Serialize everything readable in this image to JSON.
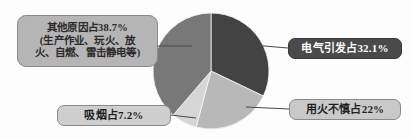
{
  "chart_data": {
    "type": "pie",
    "title": "",
    "xlabel": "",
    "ylabel": "",
    "legend_position": "callout-labels",
    "grid": false,
    "start_angle_deg": 0,
    "direction": "clockwise",
    "categories": [
      "电气引发",
      "用火不慎",
      "吸烟",
      "其他原因"
    ],
    "values": [
      32.1,
      22.0,
      7.2,
      38.7
    ],
    "unit": "%",
    "colors": [
      "#434343",
      "#b8b8b8",
      "#d6d6d6",
      "#787878"
    ],
    "slices": [
      {
        "name": "电气引发",
        "value": 32.1,
        "label": "电气引发占32.1%",
        "color": "#434343",
        "start_deg": 0,
        "end_deg": 115.56
      },
      {
        "name": "用火不慎",
        "value": 22.0,
        "label": "用火不慎占22%",
        "color": "#b8b8b8",
        "start_deg": 115.56,
        "end_deg": 194.76
      },
      {
        "name": "吸烟",
        "value": 7.2,
        "label": "吸烟占7.2%",
        "color": "#d6d6d6",
        "start_deg": 194.76,
        "end_deg": 220.68
      },
      {
        "name": "其他原因",
        "value": 38.7,
        "label": "其他原因占38.7%",
        "color": "#787878",
        "start_deg": 220.68,
        "end_deg": 360
      }
    ]
  },
  "callouts": {
    "other": {
      "line1": "其他原因占38.7%",
      "line2": "(生产作业、玩火、放",
      "line3": "火、自燃、雷击静电等)"
    },
    "electric": {
      "text": "电气引发占32.1%"
    },
    "careless": {
      "text": "用火不慎占22%"
    },
    "smoking": {
      "text": "吸烟占7.2%"
    }
  },
  "style": {
    "background": "#fdfdfd",
    "leader_line_color": "#4a4a4a",
    "pie_outline": "#ffffff"
  }
}
